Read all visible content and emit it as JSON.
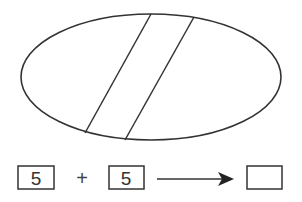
{
  "diagram": {
    "type": "ellipse-with-band",
    "stroke_color": "#333333",
    "ellipse": {
      "cx": 151,
      "cy": 77,
      "rx": 130,
      "ry": 63
    },
    "band_lines": [
      {
        "x1": 151,
        "y1": 14,
        "x2": 85,
        "y2": 133
      },
      {
        "x1": 194,
        "y1": 17,
        "x2": 125,
        "y2": 140
      }
    ]
  },
  "equation": {
    "operand_1": "5",
    "operator": "+",
    "operand_2": "5",
    "arrow": "right-arrow",
    "result": ""
  }
}
